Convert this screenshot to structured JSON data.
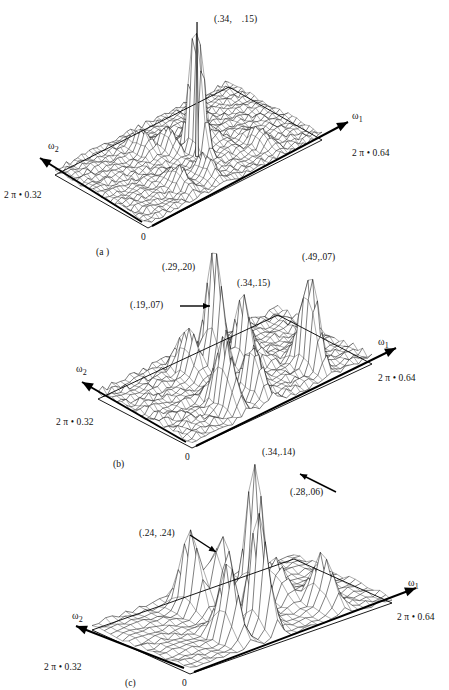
{
  "figure": {
    "background": "#ffffff",
    "ink": "#000000"
  },
  "axis_labels": {
    "omega1": "ω",
    "omega1_sub": "1",
    "omega2": "ω",
    "omega2_sub": "2",
    "omega1_max": "2 π • 0.64",
    "omega2_max": "2 π • 0.32",
    "origin": "0"
  },
  "panels": [
    {
      "id": "a",
      "caption": "(a )",
      "peak_labels": [
        {
          "text": "(.34,    .15)",
          "leader": "none"
        }
      ]
    },
    {
      "id": "b",
      "caption": "(b)",
      "peak_labels": [
        {
          "text": "(.29,.20)",
          "leader": "none"
        },
        {
          "text": "(.34,.15)",
          "leader": "none"
        },
        {
          "text": "(.49,.07)",
          "leader": "none"
        },
        {
          "text": "(.19,.07)",
          "leader": "horizontal-arrow"
        }
      ]
    },
    {
      "id": "c",
      "caption": "(c)",
      "peak_labels": [
        {
          "text": "(.34,.14)",
          "leader": "none"
        },
        {
          "text": "(.28,.06)",
          "leader": "diagonal-arrow"
        },
        {
          "text": "(.24, .24)",
          "leader": "diagonal-arrow"
        }
      ]
    }
  ],
  "chart_data": {
    "type": "surface",
    "xlabel": "ω₁",
    "ylabel": "ω₂",
    "zlabel": "magnitude",
    "xlim": [
      0,
      0.64
    ],
    "ylim": [
      0,
      0.32
    ],
    "x_tick_labels": [
      "0",
      "2 π • 0.64"
    ],
    "y_tick_labels": [
      "0",
      "2 π • 0.32"
    ],
    "grid": false,
    "legend": "none",
    "projection": "3d-wireframe",
    "subplots": [
      {
        "id": "a",
        "label": "(a )",
        "grid_nx": 46,
        "grid_ny": 22,
        "noise_floor": 0.055,
        "noise_seed": 17,
        "peaks": [
          {
            "x": 0.34,
            "y": 0.15,
            "z": 1.0,
            "sigma": 0.012,
            "labeled": true,
            "label": "(.34,    .15)"
          },
          {
            "x": 0.29,
            "y": 0.2,
            "z": 0.16,
            "sigma": 0.016,
            "labeled": false
          },
          {
            "x": 0.24,
            "y": 0.24,
            "z": 0.13,
            "sigma": 0.018,
            "labeled": false
          },
          {
            "x": 0.19,
            "y": 0.07,
            "z": 0.12,
            "sigma": 0.018,
            "labeled": false
          },
          {
            "x": 0.28,
            "y": 0.06,
            "z": 0.14,
            "sigma": 0.016,
            "labeled": false
          },
          {
            "x": 0.49,
            "y": 0.07,
            "z": 0.1,
            "sigma": 0.018,
            "labeled": false
          },
          {
            "x": 0.41,
            "y": 0.18,
            "z": 0.09,
            "sigma": 0.02,
            "labeled": false
          }
        ]
      },
      {
        "id": "b",
        "label": "(b)",
        "grid_nx": 40,
        "grid_ny": 20,
        "noise_floor": 0.09,
        "noise_seed": 29,
        "peaks": [
          {
            "x": 0.29,
            "y": 0.2,
            "z": 1.0,
            "sigma": 0.016,
            "labeled": true,
            "label": "(.29,.20)"
          },
          {
            "x": 0.34,
            "y": 0.15,
            "z": 0.66,
            "sigma": 0.016,
            "labeled": true,
            "label": "(.34,.15)"
          },
          {
            "x": 0.49,
            "y": 0.07,
            "z": 0.8,
            "sigma": 0.016,
            "labeled": true,
            "label": "(.49,.07)"
          },
          {
            "x": 0.19,
            "y": 0.07,
            "z": 0.54,
            "sigma": 0.018,
            "labeled": true,
            "label": "(.19,.07)"
          },
          {
            "x": 0.24,
            "y": 0.24,
            "z": 0.36,
            "sigma": 0.018,
            "labeled": false
          },
          {
            "x": 0.28,
            "y": 0.06,
            "z": 0.4,
            "sigma": 0.018,
            "labeled": false
          },
          {
            "x": 0.41,
            "y": 0.2,
            "z": 0.22,
            "sigma": 0.022,
            "labeled": false
          }
        ]
      },
      {
        "id": "c",
        "label": "(c)",
        "grid_nx": 30,
        "grid_ny": 16,
        "noise_floor": 0.05,
        "noise_seed": 41,
        "peaks": [
          {
            "x": 0.34,
            "y": 0.14,
            "z": 1.0,
            "sigma": 0.016,
            "labeled": true,
            "label": "(.34,.14)"
          },
          {
            "x": 0.28,
            "y": 0.06,
            "z": 0.78,
            "sigma": 0.017,
            "labeled": true,
            "label": "(.28,.06)"
          },
          {
            "x": 0.24,
            "y": 0.24,
            "z": 0.56,
            "sigma": 0.018,
            "labeled": true,
            "label": "(.24, .24)"
          },
          {
            "x": 0.19,
            "y": 0.07,
            "z": 0.5,
            "sigma": 0.018,
            "labeled": false
          },
          {
            "x": 0.29,
            "y": 0.2,
            "z": 0.62,
            "sigma": 0.016,
            "labeled": false
          },
          {
            "x": 0.49,
            "y": 0.07,
            "z": 0.34,
            "sigma": 0.02,
            "labeled": false
          },
          {
            "x": 0.44,
            "y": 0.18,
            "z": 0.26,
            "sigma": 0.022,
            "labeled": false
          }
        ]
      }
    ]
  }
}
